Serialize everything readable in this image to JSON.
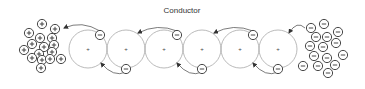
{
  "diagram": {
    "title": "Conductor",
    "colors": {
      "atom_stroke": "#a8a8a8",
      "charge_stroke": "#333333",
      "arrow": "#444444",
      "text": "#333333"
    },
    "atoms": [
      {
        "cx": 88,
        "cy": 49,
        "r": 19,
        "nucleus": "+",
        "electron_top": {
          "cx": 100,
          "cy": 35
        }
      },
      {
        "cx": 126,
        "cy": 49,
        "r": 19,
        "nucleus": "+",
        "electron_bottom": {
          "cx": 126,
          "cy": 69
        }
      },
      {
        "cx": 164,
        "cy": 49,
        "r": 19,
        "nucleus": "+",
        "electron_top": {
          "cx": 177,
          "cy": 35
        }
      },
      {
        "cx": 202,
        "cy": 49,
        "r": 19,
        "nucleus": "+",
        "electron_bottom": {
          "cx": 202,
          "cy": 69
        }
      },
      {
        "cx": 240,
        "cy": 49,
        "r": 19,
        "nucleus": "+",
        "electron_top": {
          "cx": 253,
          "cy": 35
        }
      },
      {
        "cx": 278,
        "cy": 49,
        "r": 19,
        "nucleus": "+",
        "electron_bottom": {
          "cx": 278,
          "cy": 69
        }
      }
    ],
    "left_terminal": {
      "label": "positive-charge-cluster",
      "sign": "+",
      "charges": [
        [
          42,
          24
        ],
        [
          55,
          29
        ],
        [
          29,
          33
        ],
        [
          40,
          38
        ],
        [
          52,
          38
        ],
        [
          32,
          44
        ],
        [
          44,
          47
        ],
        [
          54,
          45
        ],
        [
          24,
          50
        ],
        [
          39,
          54
        ],
        [
          52,
          52
        ],
        [
          32,
          58
        ],
        [
          42,
          60
        ],
        [
          50,
          59
        ],
        [
          61,
          59
        ],
        [
          41,
          68
        ]
      ]
    },
    "right_terminal": {
      "label": "negative-charge-cluster",
      "sign": "-",
      "charges": [
        [
          324,
          24
        ],
        [
          311,
          28
        ],
        [
          338,
          32
        ],
        [
          316,
          37
        ],
        [
          327,
          37
        ],
        [
          310,
          46
        ],
        [
          323,
          47
        ],
        [
          336,
          43
        ],
        [
          343,
          55
        ],
        [
          314,
          56
        ],
        [
          327,
          58
        ],
        [
          303,
          66
        ],
        [
          318,
          66
        ],
        [
          335,
          65
        ],
        [
          328,
          73
        ]
      ]
    },
    "arrows": [
      {
        "from": [
          100,
          31
        ],
        "to": [
          64,
          28
        ]
      },
      {
        "from": [
          126,
          72
        ],
        "to": [
          101,
          63
        ]
      },
      {
        "from": [
          177,
          31
        ],
        "to": [
          138,
          33
        ]
      },
      {
        "from": [
          202,
          72
        ],
        "to": [
          177,
          63
        ]
      },
      {
        "from": [
          253,
          31
        ],
        "to": [
          214,
          33
        ]
      },
      {
        "from": [
          278,
          72
        ],
        "to": [
          253,
          63
        ]
      },
      {
        "from": [
          305,
          28
        ],
        "to": [
          289,
          33
        ]
      }
    ]
  }
}
